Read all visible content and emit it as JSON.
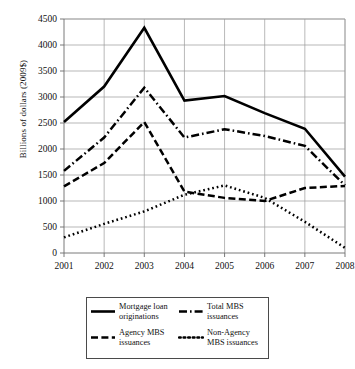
{
  "chart_data": {
    "type": "line",
    "title": "",
    "xlabel": "",
    "ylabel": "Billions of dollars (2009$)",
    "categories": [
      "2001",
      "2002",
      "2003",
      "2004",
      "2005",
      "2006",
      "2007",
      "2008"
    ],
    "x": [
      2001,
      2002,
      2003,
      2004,
      2005,
      2006,
      2007,
      2008
    ],
    "xlim": [
      2001,
      2008
    ],
    "ylim": [
      0,
      4500
    ],
    "yticks": [
      0,
      500,
      1000,
      1500,
      2000,
      2500,
      3000,
      3500,
      4000,
      4500
    ],
    "ytick_labels": [
      "0",
      "500",
      "1000",
      "1500",
      "2000",
      "2500",
      "3000",
      "3500",
      "4000",
      "4500"
    ],
    "grid": true,
    "grid_axis": "both",
    "legend_position": "below",
    "series": [
      {
        "name": "Mortgage loan originations",
        "label": "Mortgage loan\noriginations",
        "linestyle": "solid",
        "color": "#000000",
        "values": [
          2520,
          3200,
          4330,
          2930,
          3020,
          2690,
          2390,
          1470
        ]
      },
      {
        "name": "Total MBS issuances",
        "label": "Total MBS\nissuances",
        "linestyle": "dash-dot",
        "color": "#000000",
        "values": [
          1580,
          2220,
          3180,
          2220,
          2380,
          2250,
          2060,
          1300
        ]
      },
      {
        "name": "Agency MBS issuances",
        "label": "Agency MBS\nissuances",
        "linestyle": "dashed",
        "color": "#000000",
        "values": [
          1280,
          1730,
          2520,
          1180,
          1060,
          1000,
          1250,
          1290
        ]
      },
      {
        "name": "Non-Agency MBS issuances",
        "label": "Non-Agency\nMBS issuances",
        "linestyle": "dotted",
        "color": "#000000",
        "values": [
          300,
          560,
          800,
          1120,
          1300,
          1060,
          600,
          100
        ]
      }
    ]
  },
  "legend": {
    "entries": [
      {
        "label": "Mortgage loan\noriginations",
        "style": "solid"
      },
      {
        "label": "Total MBS\nissuances",
        "style": "dash-dot"
      },
      {
        "label": "Agency MBS\nissuances",
        "style": "dashed"
      },
      {
        "label": "Non-Agency\nMBS issuances",
        "style": "dotted"
      }
    ]
  }
}
